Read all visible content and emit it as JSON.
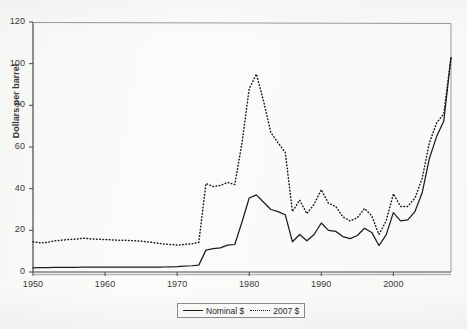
{
  "chart_data": {
    "type": "line",
    "title": "",
    "xlabel": "",
    "ylabel": "Dollars per barrel",
    "xlim": [
      1950,
      2008
    ],
    "ylim": [
      0,
      120
    ],
    "y_ticks": [
      0,
      20,
      40,
      60,
      80,
      100,
      120
    ],
    "x_ticks": [
      1950,
      1960,
      1970,
      1980,
      1990,
      2000
    ],
    "grid": false,
    "legend_position": "bottom-center",
    "x": [
      1950,
      1951,
      1952,
      1953,
      1954,
      1955,
      1956,
      1957,
      1958,
      1959,
      1960,
      1961,
      1962,
      1963,
      1964,
      1965,
      1966,
      1967,
      1968,
      1969,
      1970,
      1971,
      1972,
      1973,
      1974,
      1975,
      1976,
      1977,
      1978,
      1979,
      1980,
      1981,
      1982,
      1983,
      1984,
      1985,
      1986,
      1987,
      1988,
      1989,
      1990,
      1991,
      1992,
      1993,
      1994,
      1995,
      1996,
      1997,
      1998,
      1999,
      2000,
      2001,
      2002,
      2003,
      2004,
      2005,
      2006,
      2007,
      2008
    ],
    "series": [
      {
        "name": "Nominal $",
        "style": "solid",
        "color": "#1c1c1c",
        "values": [
          2.0,
          2.1,
          2.1,
          2.2,
          2.2,
          2.2,
          2.2,
          2.4,
          2.4,
          2.4,
          2.4,
          2.4,
          2.4,
          2.4,
          2.4,
          2.4,
          2.4,
          2.4,
          2.4,
          2.5,
          2.6,
          2.8,
          3.0,
          3.3,
          10.5,
          11.2,
          11.6,
          12.9,
          13.2,
          24.0,
          35.5,
          37.0,
          33.5,
          30.0,
          29.0,
          27.5,
          14.5,
          18.0,
          15.0,
          18.0,
          23.5,
          20.0,
          19.5,
          17.0,
          16.0,
          17.5,
          21.0,
          19.0,
          12.7,
          17.8,
          28.5,
          24.5,
          25.0,
          29.0,
          38.0,
          54.5,
          65.0,
          72.5,
          103.0
        ]
      },
      {
        "name": "2007 $",
        "style": "dotted",
        "color": "#1c1c1c",
        "values": [
          14.5,
          14.0,
          14.2,
          15.0,
          15.3,
          15.6,
          15.8,
          16.2,
          15.9,
          15.7,
          15.6,
          15.4,
          15.2,
          15.2,
          15.0,
          14.8,
          14.4,
          14.0,
          13.5,
          13.2,
          12.9,
          13.2,
          13.5,
          14.2,
          42.5,
          41.0,
          41.5,
          43.0,
          42.0,
          62.0,
          88.0,
          95.0,
          82.0,
          67.0,
          62.0,
          57.5,
          29.0,
          34.5,
          28.0,
          32.5,
          39.5,
          33.0,
          31.5,
          26.5,
          24.5,
          26.0,
          30.5,
          27.0,
          18.0,
          24.5,
          37.5,
          31.5,
          31.5,
          35.5,
          45.0,
          62.0,
          71.5,
          76.0,
          103.0
        ]
      }
    ]
  },
  "axes": {
    "y_title": "Dollars per barrel",
    "y_tick_labels": [
      "0",
      "20",
      "40",
      "60",
      "80",
      "100",
      "120"
    ],
    "x_tick_labels": [
      "1950",
      "1960",
      "1970",
      "1980",
      "1990",
      "2000"
    ]
  },
  "legend": {
    "items": [
      {
        "label": "Nominal $",
        "style": "solid"
      },
      {
        "label": "2007 $",
        "style": "dotted"
      }
    ]
  }
}
